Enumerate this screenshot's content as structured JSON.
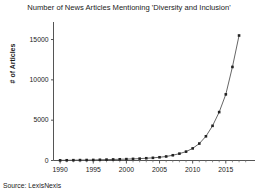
{
  "chart_data": {
    "type": "line",
    "title": "Number of News Articles Mentioning 'Diversity and Inclusion'",
    "xlabel": "",
    "ylabel": "# of Articles",
    "source_note": "Source: LexisNexis",
    "grid": false,
    "legend": "none",
    "marker": "square",
    "line_color": "#555555",
    "marker_color": "#222222",
    "xlim": [
      1989,
      2018.5
    ],
    "ylim": [
      0,
      16800
    ],
    "xticks": [
      1990,
      1995,
      2000,
      2005,
      2010,
      2015
    ],
    "xtick_labels": [
      "1990",
      "1995",
      "2000",
      "2005",
      "2010",
      "2015"
    ],
    "yticks": [
      0,
      5000,
      10000,
      15000
    ],
    "ytick_labels": [
      "0",
      "5000",
      "10000",
      "15000"
    ],
    "x": [
      1990,
      1991,
      1992,
      1993,
      1994,
      1995,
      1996,
      1997,
      1998,
      1999,
      2000,
      2001,
      2002,
      2003,
      2004,
      2005,
      2006,
      2007,
      2008,
      2009,
      2010,
      2011,
      2012,
      2013,
      2014,
      2015,
      2016,
      2017
    ],
    "values": [
      20,
      30,
      40,
      50,
      60,
      70,
      90,
      110,
      130,
      150,
      170,
      200,
      230,
      280,
      330,
      400,
      500,
      650,
      850,
      1100,
      1500,
      2100,
      3000,
      4300,
      6000,
      8200,
      11600,
      15500
    ]
  }
}
